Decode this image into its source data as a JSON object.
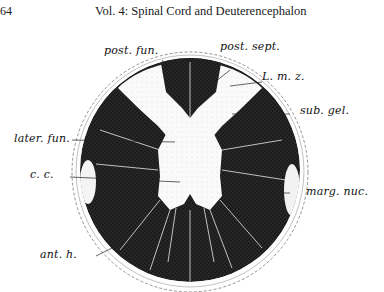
{
  "page": {
    "number": "64",
    "running_head": "Vol. 4: Spinal Cord and Deuterencephalon"
  },
  "figure": {
    "labels": {
      "post_fun": "post. fun.",
      "post_sept": "post. sept.",
      "lmz": "L. m. z.",
      "sub_gel": "sub. gel.",
      "later_fun": "later. fun.",
      "cc": "c. c.",
      "marg_nuc": "marg. nuc.",
      "ant_h": "ant. h."
    }
  }
}
